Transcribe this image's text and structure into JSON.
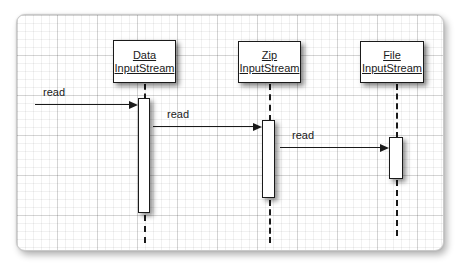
{
  "diagram": {
    "type": "uml-sequence-diagram",
    "colors": {
      "line": "#1a1a1a",
      "box_fill": "#ffffff",
      "panel_border": "#c9c9c9",
      "background": "#ffffff"
    },
    "objects": [
      {
        "name": "DataInputStream",
        "line1": "Data",
        "line2": "InputStream"
      },
      {
        "name": "ZipInputStream",
        "line1": "Zip",
        "line2": "InputStream"
      },
      {
        "name": "FileInputStream",
        "line1": "File",
        "line2": "InputStream"
      }
    ],
    "messages": [
      {
        "label": "read",
        "from": "external",
        "to": "DataInputStream"
      },
      {
        "label": "read",
        "from": "DataInputStream",
        "to": "ZipInputStream"
      },
      {
        "label": "read",
        "from": "ZipInputStream",
        "to": "FileInputStream"
      }
    ]
  }
}
